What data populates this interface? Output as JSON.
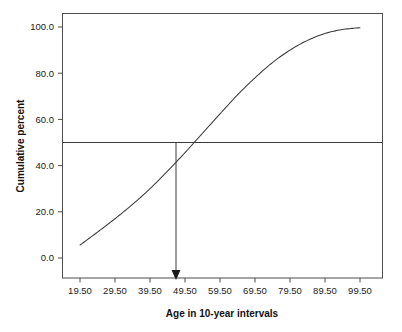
{
  "chart_data": {
    "type": "line",
    "title": "",
    "subtitle": "",
    "xlabel": "Age in 10-year intervals",
    "ylabel": "Cumulative percent",
    "xlim": [
      14.5,
      104.5
    ],
    "ylim": [
      -7.0,
      102.0
    ],
    "grid": false,
    "legend": null,
    "x_tick_labels": [
      "19.50",
      "29.50",
      "39.50",
      "49.50",
      "59.50",
      "69.50",
      "79.50",
      "89.50",
      "99.50"
    ],
    "x_tick_values": [
      19.5,
      29.5,
      39.5,
      49.5,
      59.5,
      69.5,
      79.5,
      89.5,
      99.5
    ],
    "y_tick_labels": [
      "0.0",
      "20.0",
      "40.0",
      "60.0",
      "80.0",
      "100.0"
    ],
    "y_tick_values": [
      0,
      20,
      40,
      60,
      80,
      100
    ],
    "series": [
      {
        "name": "Cumulative percent (ogive)",
        "x": [
          19.5,
          24.5,
          29.5,
          34.5,
          39.5,
          44.5,
          49.5,
          54.5,
          59.5,
          64.5,
          69.5,
          74.5,
          79.5,
          84.5,
          89.5,
          94.5,
          99.5
        ],
        "values": [
          5.6,
          11.2,
          17.0,
          23.2,
          30.0,
          37.6,
          45.6,
          54.0,
          62.4,
          70.6,
          78.0,
          84.6,
          90.0,
          94.2,
          97.2,
          98.9,
          99.7
        ]
      }
    ],
    "annotations": [
      {
        "name": "median-reference-line",
        "kind": "horizontal-line",
        "y": 50.0,
        "label": ""
      },
      {
        "name": "median-arrow",
        "kind": "vertical-arrow",
        "x": 46.0,
        "y_from": 50.0,
        "y_to": -7.0,
        "label": ""
      }
    ]
  },
  "axes": {
    "y_title": "Cumulative percent",
    "x_title": "Age in 10-year intervals"
  }
}
